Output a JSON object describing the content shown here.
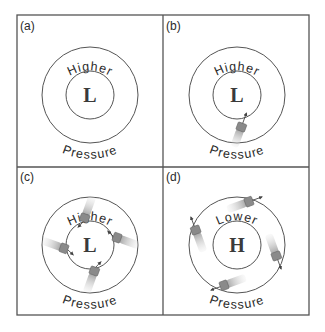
{
  "figure": {
    "panels": [
      {
        "id": "a",
        "label": "(a)",
        "top_text": "Higher",
        "bottom_text": "Pressure",
        "center": "L",
        "parcels": 0
      },
      {
        "id": "b",
        "label": "(b)",
        "top_text": "Higher",
        "bottom_text": "Pressure",
        "center": "L",
        "parcels": 1
      },
      {
        "id": "c",
        "label": "(c)",
        "top_text": "Higher",
        "bottom_text": "Pressure",
        "center": "L",
        "parcels": 4
      },
      {
        "id": "d",
        "label": "(d)",
        "top_text": "Lower",
        "bottom_text": "Pressure",
        "center": "H",
        "parcels": 4
      }
    ],
    "colors": {
      "line": "#555555",
      "parcel": "#8a8a8a",
      "parcel_trail": "#c8c8c8",
      "text": "#2a2a2a"
    }
  }
}
